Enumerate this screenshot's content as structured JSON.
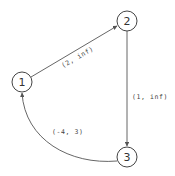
{
  "diagram": {
    "type": "directed-graph",
    "nodes": [
      {
        "id": "1",
        "label": "1",
        "cx": 22,
        "cy": 82,
        "r": 10
      },
      {
        "id": "2",
        "label": "2",
        "cx": 127,
        "cy": 21,
        "r": 10
      },
      {
        "id": "3",
        "label": "3",
        "cx": 127,
        "cy": 157,
        "r": 10
      }
    ],
    "edges": [
      {
        "from": "1",
        "to": "2",
        "label": "(2, inf)"
      },
      {
        "from": "2",
        "to": "3",
        "label": "(1, inf)"
      },
      {
        "from": "3",
        "to": "1",
        "label": "(-4, 3)"
      }
    ],
    "colors": {
      "stroke": "#555555",
      "text": "#333333",
      "background": "#ffffff"
    }
  }
}
